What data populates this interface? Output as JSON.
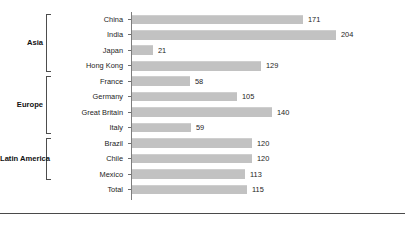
{
  "chart_data": {
    "type": "bar",
    "orientation": "horizontal",
    "title": "",
    "subtitle": "",
    "xlabel": "",
    "ylabel": "",
    "xlim": [
      0,
      204
    ],
    "grid": false,
    "legend": null,
    "bar_color": "#c2c2c2",
    "axis_color": "#7d7d7d",
    "label_color": "#1c1c1c",
    "categories": [
      "China",
      "India",
      "Japan",
      "Hong Kong",
      "France",
      "Germany",
      "Great Britain",
      "Italy",
      "Brazil",
      "Chile",
      "Mexico",
      "Total"
    ],
    "values": [
      171,
      204,
      21,
      129,
      58,
      105,
      140,
      59,
      120,
      120,
      113,
      115
    ],
    "data_labels": [
      "171",
      "204",
      "21",
      "129",
      "58",
      "105",
      "140",
      "59",
      "120",
      "120",
      "113",
      "115"
    ],
    "groups": [
      {
        "label": "Asia",
        "start_index": 0,
        "end_index": 3
      },
      {
        "label": "Europe",
        "start_index": 4,
        "end_index": 7
      },
      {
        "label": "Latin America",
        "start_index": 8,
        "end_index": 10
      }
    ],
    "ungrouped": [
      "Total"
    ]
  }
}
